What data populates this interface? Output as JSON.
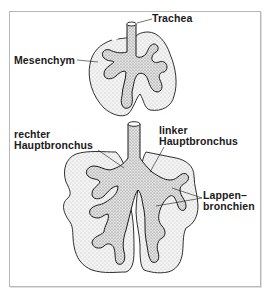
{
  "diagram": {
    "type": "anatomical-illustration",
    "colors": {
      "background": "#ffffff",
      "frame": "#b8b8b8",
      "mesenchym_fill": "#ececec",
      "bronchus_fill": "#d6d6d6",
      "outline": "#1a1a1a"
    },
    "stages": [
      {
        "name": "early-stage-lung",
        "labels": {
          "trachea": "Trachea",
          "mesenchym": "Mesenchym"
        }
      },
      {
        "name": "later-stage-lung",
        "labels": {
          "rechter_line1": "rechter",
          "rechter_line2": "Hauptbronchus",
          "linker_line1": "linker",
          "linker_line2": "Hauptbronchus",
          "lappen_line1": "Lappen–",
          "lappen_line2": "bronchien"
        }
      }
    ]
  }
}
